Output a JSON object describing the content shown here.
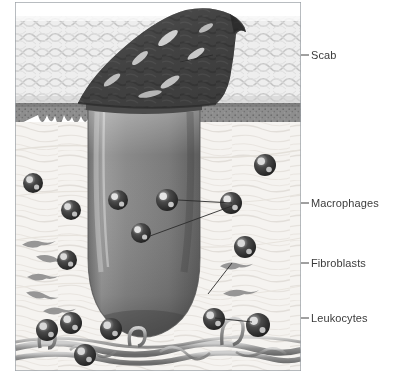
{
  "figure": {
    "frame": {
      "x": 15,
      "y": 2,
      "width": 286,
      "height": 369,
      "border_color": "#9aa0a6"
    },
    "background_color": "#ffffff"
  },
  "labels": [
    {
      "id": "scab",
      "text": "Scab",
      "x": 311,
      "y": 50,
      "leader": {
        "x1": 301,
        "y1": 55,
        "x2": 213,
        "y2": 55,
        "kind": "horizontal-then-diagonal"
      }
    },
    {
      "id": "macrophages",
      "text": "Macrophages",
      "x": 311,
      "y": 198,
      "leader": {
        "x1": 301,
        "y1": 203,
        "x2": 232,
        "y2": 203,
        "kind": "horizontal-then-diagonal"
      }
    },
    {
      "id": "fibroblasts",
      "text": "Fibroblasts",
      "x": 311,
      "y": 258,
      "leader": {
        "x1": 301,
        "y1": 263,
        "x2": 232,
        "y2": 263,
        "kind": "horizontal-then-diagonal"
      }
    },
    {
      "id": "leukocytes",
      "text": "Leukocytes",
      "x": 311,
      "y": 313,
      "leader": {
        "x1": 301,
        "y1": 318,
        "x2": 215,
        "y2": 318,
        "kind": "horizontal-then-diagonal"
      }
    }
  ],
  "layers": [
    {
      "id": "epidermis",
      "label_internal": "epidermis",
      "y_top": 16,
      "y_bottom": 104,
      "fill": "#e9e9e9",
      "texture": "woven-crosshatch"
    },
    {
      "id": "stratum-basale",
      "label_internal": "stratum basale",
      "y_top": 104,
      "y_bottom": 132,
      "fill": "#8d8d8d",
      "texture": "stippled-rete-ridges"
    },
    {
      "id": "dermis",
      "label_internal": "dermis",
      "y_top": 132,
      "y_bottom": 348,
      "fill": "#f4f2ef",
      "texture": "fibrous-collagen"
    },
    {
      "id": "vascular-plexus",
      "label_internal": "blood vessels",
      "y_top": 330,
      "y_bottom": 370,
      "fill": "#a9a9a9",
      "texture": "vessel-network"
    }
  ],
  "structures": {
    "scab": {
      "fill_dark": "#3f3f3f",
      "fill_mid": "#5a5a5a",
      "highlight": "#e8e8e8"
    },
    "clot_plug": {
      "fill_light": "#9a9a9a",
      "fill_mid": "#7e7e7e",
      "fill_dark": "#5e5e5e",
      "top_y": 104,
      "bottom_y": 330,
      "left_x": 88,
      "right_x": 200
    }
  },
  "cells": {
    "macrophage_color": "#2e2e2e",
    "macrophage_highlight": "#d8d8d8",
    "fibroblast_color": "#8a8a8a",
    "macrophages": [
      {
        "x": 118,
        "y": 200,
        "r": 10
      },
      {
        "x": 167,
        "y": 200,
        "r": 11
      },
      {
        "x": 141,
        "y": 233,
        "r": 10
      },
      {
        "x": 231,
        "y": 203,
        "r": 11
      }
    ],
    "leukocytes": [
      {
        "x": 33,
        "y": 183,
        "r": 10
      },
      {
        "x": 71,
        "y": 210,
        "r": 10
      },
      {
        "x": 67,
        "y": 260,
        "r": 10
      },
      {
        "x": 265,
        "y": 165,
        "r": 11
      },
      {
        "x": 245,
        "y": 247,
        "r": 11
      },
      {
        "x": 71,
        "y": 323,
        "r": 11
      },
      {
        "x": 47,
        "y": 330,
        "r": 11
      },
      {
        "x": 111,
        "y": 329,
        "r": 11
      },
      {
        "x": 214,
        "y": 319,
        "r": 11
      },
      {
        "x": 258,
        "y": 325,
        "r": 12
      },
      {
        "x": 85,
        "y": 355,
        "r": 11
      }
    ],
    "fibroblasts": [
      {
        "x": 35,
        "y": 243,
        "len": 26,
        "rot": -8
      },
      {
        "x": 50,
        "y": 258,
        "len": 30,
        "rot": 6
      },
      {
        "x": 40,
        "y": 276,
        "len": 28,
        "rot": -4
      },
      {
        "x": 38,
        "y": 294,
        "len": 26,
        "rot": 7
      },
      {
        "x": 55,
        "y": 310,
        "len": 26,
        "rot": -6
      },
      {
        "x": 237,
        "y": 292,
        "len": 30,
        "rot": -7
      },
      {
        "x": 232,
        "y": 265,
        "len": 26,
        "rot": -6
      }
    ]
  }
}
